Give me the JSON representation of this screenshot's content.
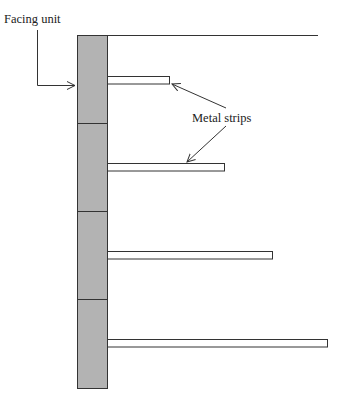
{
  "diagram": {
    "type": "retaining-wall-reinforcement",
    "labels": {
      "facing_unit": "Facing unit",
      "metal_strips": "Metal strips"
    },
    "colors": {
      "facing_fill": "#b3b3b3",
      "line": "#333333",
      "strip_fill": "#ffffff",
      "background": "#ffffff"
    },
    "facing_units": 4,
    "metal_strips": [
      {
        "index": 1,
        "relative_length": "short"
      },
      {
        "index": 2,
        "relative_length": "medium"
      },
      {
        "index": 3,
        "relative_length": "long"
      },
      {
        "index": 4,
        "relative_length": "longest"
      }
    ]
  }
}
